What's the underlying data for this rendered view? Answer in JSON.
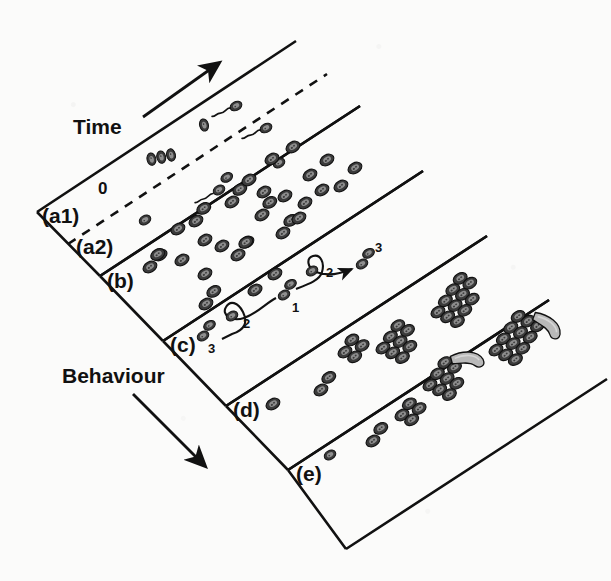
{
  "figure": {
    "background_color": "#fbfbfa",
    "ink_color": "#111111",
    "cell_fill_color": "#4a4a4a",
    "swarmer_fill_color": "#b9b9b9"
  },
  "axes": {
    "time": {
      "label": "Time",
      "direction": "up-right",
      "arrow": "arrow-up-right"
    },
    "behaviour": {
      "label": "Behaviour",
      "direction": "down-right",
      "arrow": "arrow-down-right"
    }
  },
  "origin_tick": {
    "label": "0"
  },
  "bands": [
    {
      "id": "a1",
      "label": "(a1)",
      "description": "single swimming cells with flagella"
    },
    {
      "id": "a2",
      "label": "(a2)",
      "description": "dense short cells, dashed divider from a1"
    },
    {
      "id": "b",
      "label": "(b)",
      "description": "paired and isolated cells"
    },
    {
      "id": "c",
      "label": "(c)",
      "description": "swimming trajectories with loops"
    },
    {
      "id": "d",
      "label": "(d)",
      "description": "small rafts and growing clusters"
    },
    {
      "id": "e",
      "label": "(e)",
      "description": "large clusters with elongated swarmer cells"
    }
  ],
  "trajectory_labels": [
    {
      "text": "3",
      "track": "left-track-start"
    },
    {
      "text": "2",
      "track": "left-track-loop"
    },
    {
      "text": "1",
      "track": "centre"
    },
    {
      "text": "2",
      "track": "right-track-loop"
    },
    {
      "text": "3",
      "track": "right-track-end"
    }
  ]
}
